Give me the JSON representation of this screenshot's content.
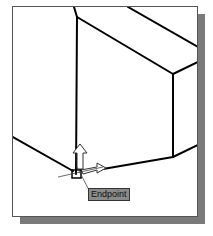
{
  "viewport": {
    "snap_tooltip": "Endpoint",
    "snap_marker": "endpoint-square",
    "cursor": "ucs-crosshair"
  }
}
